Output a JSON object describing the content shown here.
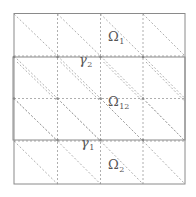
{
  "diagram": {
    "type": "domain-decomposition-mesh",
    "grid": {
      "columns": 4,
      "rows": 4,
      "cell_diagonals": "top-left to bottom-right"
    },
    "colors": {
      "border": "#8a8a8a",
      "dashed": "#9a9a9a",
      "label": "#555555"
    },
    "labels": {
      "omega1": {
        "symbol": "Ω",
        "subscript": "1"
      },
      "omega12": {
        "symbol": "Ω",
        "subscript": "12"
      },
      "omega2": {
        "symbol": "Ω",
        "subscript": "2"
      },
      "gamma2": {
        "symbol": "γ",
        "subscript": "2"
      },
      "gamma1": {
        "symbol": "γ",
        "subscript": "1"
      }
    }
  }
}
